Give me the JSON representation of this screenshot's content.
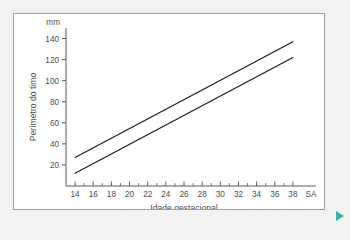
{
  "card": {
    "background": "#ffffff",
    "border_color": "#9aa0a6"
  },
  "page": {
    "background": "#f2f2f2",
    "accent_color": "#35b5b0"
  },
  "controls": {
    "play_arrow_label": "play-arrow"
  },
  "chart_data": {
    "type": "line",
    "title": "",
    "xlabel": "Idade gestacional",
    "ylabel": "Perímetro do timo",
    "x_unit": "SA",
    "y_unit": "mm",
    "xlim": [
      13,
      39
    ],
    "ylim": [
      0,
      150
    ],
    "xticks": [
      14,
      16,
      18,
      20,
      22,
      24,
      26,
      28,
      30,
      32,
      34,
      36,
      38
    ],
    "xtick_labels": [
      "14",
      "16",
      "18",
      "20",
      "22",
      "24",
      "26",
      "28",
      "30",
      "32",
      "34",
      "36",
      "38"
    ],
    "x_minor_step": 1,
    "yticks": [
      20,
      40,
      60,
      80,
      100,
      120,
      140
    ],
    "ytick_labels": [
      "20",
      "40",
      "60",
      "80",
      "100",
      "120",
      "140"
    ],
    "grid": false,
    "legend": "none",
    "series": [
      {
        "name": "upper-reference-curve",
        "color": "#1a1a1a",
        "x": [
          14,
          38
        ],
        "values": [
          27,
          137
        ]
      },
      {
        "name": "lower-reference-curve",
        "color": "#1a1a1a",
        "x": [
          14,
          38
        ],
        "values": [
          12,
          122
        ]
      }
    ]
  }
}
